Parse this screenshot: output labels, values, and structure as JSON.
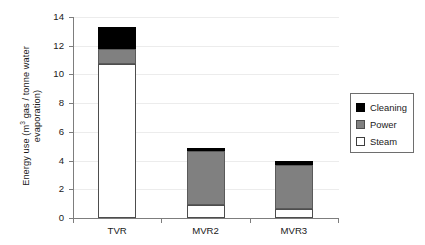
{
  "chart_data": {
    "type": "bar",
    "stacked": true,
    "title": "",
    "xlabel": "",
    "ylabel": "Energy use (m3 gas / tonne water evaporation)",
    "ylabel_line1": "Energy use (m",
    "ylabel_sup": "3",
    "ylabel_line1_rest": " gas / tonne water",
    "ylabel_line2": "evaporation)",
    "categories": [
      "TVR",
      "MVR2",
      "MVR3"
    ],
    "ylim": [
      0,
      14
    ],
    "yticks": [
      0,
      2,
      4,
      6,
      8,
      10,
      12,
      14
    ],
    "ytick_labels": [
      "0",
      "2",
      "4",
      "6",
      "8",
      "10",
      "12",
      "14"
    ],
    "grid": true,
    "grid_axis": "y",
    "legend_position": "right-outside",
    "series": [
      {
        "name": "Cleaning",
        "color": "#000000",
        "values": [
          1.5,
          0.25,
          0.3
        ]
      },
      {
        "name": "Power",
        "color": "#808080",
        "values": [
          1.05,
          3.75,
          3.05
        ]
      },
      {
        "name": "Steam",
        "color": "#ffffff",
        "values": [
          10.75,
          0.9,
          0.65
        ]
      }
    ],
    "totals": [
      13.3,
      4.9,
      4.0
    ]
  },
  "legend": {
    "items": [
      {
        "label": "Cleaning",
        "swatch": "black-square-icon"
      },
      {
        "label": "Power",
        "swatch": "gray-square-icon"
      },
      {
        "label": "Steam",
        "swatch": "white-square-icon"
      }
    ]
  }
}
